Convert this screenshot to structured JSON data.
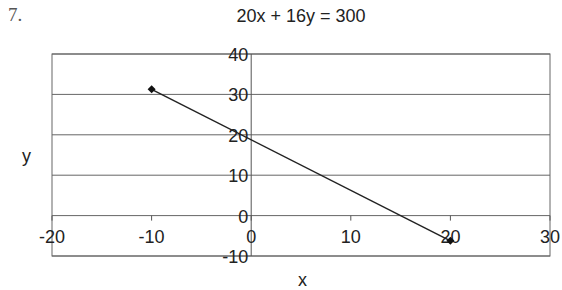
{
  "problem_number": "7.",
  "chart_data": {
    "type": "scatter",
    "title": "20x + 16y = 300",
    "xlabel": "x",
    "ylabel": "y",
    "xlim": [
      -20,
      30
    ],
    "ylim": [
      -10,
      40
    ],
    "x_ticks": [
      -20,
      -10,
      0,
      10,
      20,
      30
    ],
    "y_ticks": [
      -10,
      0,
      10,
      20,
      30,
      40
    ],
    "grid": "horizontal",
    "legend": "none",
    "series": [
      {
        "name": "20x + 16y = 300",
        "x": [
          -10,
          20
        ],
        "y": [
          31.25,
          -6.25
        ],
        "marker": "diamond",
        "line": "straight"
      }
    ]
  }
}
